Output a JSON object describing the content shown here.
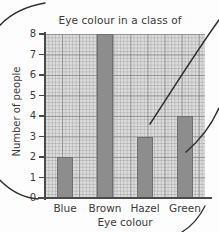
{
  "chart_data": {
    "type": "bar",
    "title": "Eye colour in a class of\n16 year old students",
    "title_line1": "Eye colour in a class of",
    "title_line2": "16 year old students",
    "xlabel": "Eye colour",
    "ylabel": "Number of people",
    "categories": [
      "Blue",
      "Brown",
      "Hazel",
      "Green"
    ],
    "values": [
      2,
      8,
      3,
      4
    ],
    "ylim": [
      0,
      8
    ],
    "ytick_labels": [
      "0",
      "1",
      "2",
      "3",
      "4",
      "5",
      "6",
      "7",
      "8"
    ],
    "ytick_values": [
      0,
      1,
      2,
      3,
      4,
      5,
      6,
      7,
      8
    ],
    "grid": true,
    "grid_style": "graph-paper",
    "legend": "none",
    "bar_color": "#8d8d8d",
    "bar_edge_color": "#6f6f6f",
    "plot_background": "#dcdcdc",
    "axis_color": "#4a4a4a",
    "text_color": "#3a3a3a"
  },
  "annotations": {
    "curve_top_left": "hand-drawn-curve",
    "curve_right_upper": "hand-drawn-curve",
    "curve_right_lower": "hand-drawn-curve",
    "curve_bottom_left": "hand-drawn-curve",
    "curve_bottom_right": "hand-drawn-curve"
  }
}
